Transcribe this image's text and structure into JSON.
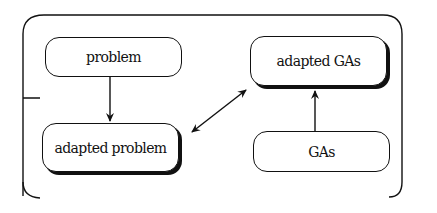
{
  "diagram": {
    "nodes": [
      {
        "id": "problem",
        "label": "problem",
        "shadow": false
      },
      {
        "id": "adapted_problem",
        "label": "adapted problem",
        "shadow": true
      },
      {
        "id": "adapted_gas",
        "label": "adapted GAs",
        "shadow": true
      },
      {
        "id": "gas",
        "label": "GAs",
        "shadow": false
      }
    ],
    "edges": [
      {
        "from": "problem",
        "to": "adapted_problem",
        "type": "directed"
      },
      {
        "from": "adapted_problem",
        "to": "adapted_gas",
        "type": "bidirectional"
      },
      {
        "from": "gas",
        "to": "adapted_gas",
        "type": "directed"
      }
    ],
    "colors": {
      "stroke": "#111111",
      "background": "#ffffff"
    }
  }
}
